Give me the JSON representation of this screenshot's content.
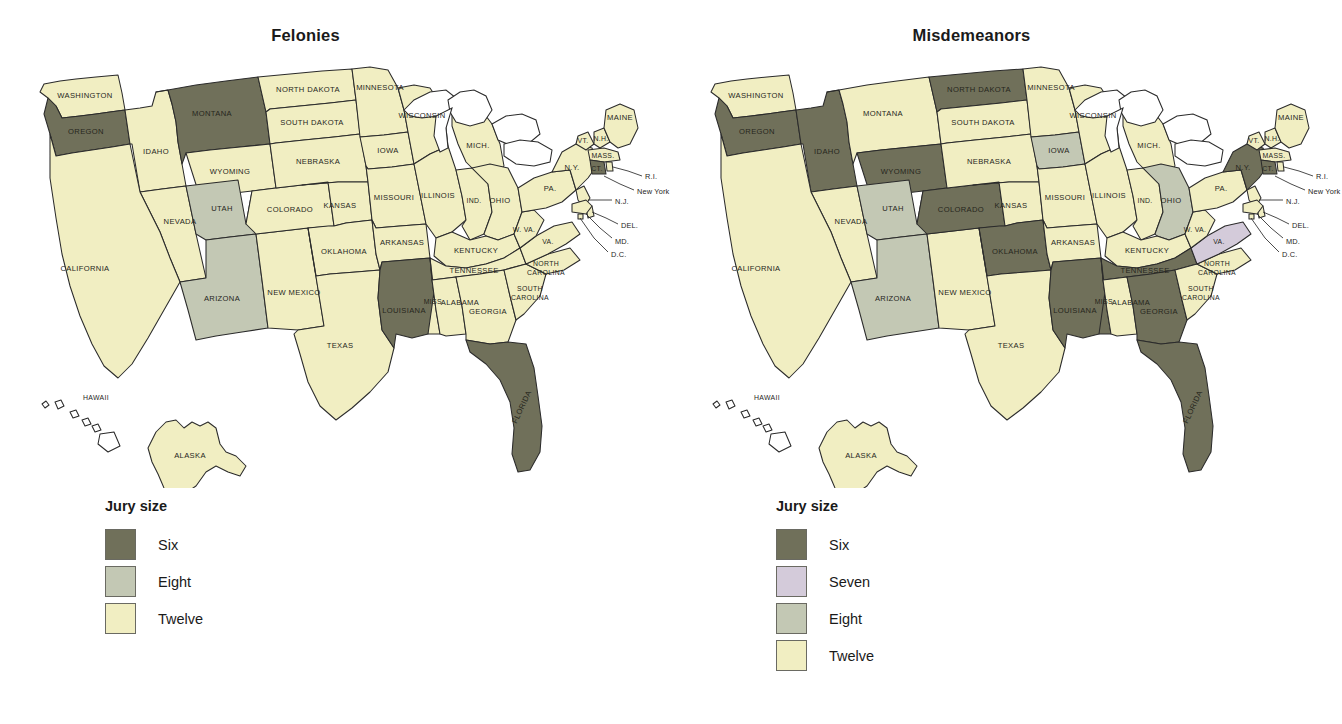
{
  "figure": {
    "cut_caption": "",
    "panels": [
      {
        "id": "felonies",
        "title": "Felonies",
        "legend": {
          "title": "Jury size",
          "items": [
            {
              "label": "Six",
              "color": "#70705a"
            },
            {
              "label": "Eight",
              "color": "#c3c8b4"
            },
            {
              "label": "Twelve",
              "color": "#f1eec2"
            }
          ]
        }
      },
      {
        "id": "misdemeanors",
        "title": "Misdemeanors",
        "legend": {
          "title": "Jury size",
          "items": [
            {
              "label": "Six",
              "color": "#70705a"
            },
            {
              "label": "Seven",
              "color": "#d4cbda"
            },
            {
              "label": "Eight",
              "color": "#c3c8b4"
            },
            {
              "label": "Twelve",
              "color": "#f1eec2"
            }
          ]
        }
      }
    ]
  },
  "chart_data": {
    "type": "map",
    "legend_title": "Jury size",
    "colors": {
      "six": "#70705a",
      "seven": "#d4cbda",
      "eight": "#c3c8b4",
      "twelve": "#f1eec2",
      "none": "#ffffff",
      "outline": "#2b2b2b"
    },
    "maps": [
      {
        "name": "Felonies",
        "categories": [
          "Six",
          "Eight",
          "Twelve"
        ],
        "values": {
          "WASHINGTON": "Twelve",
          "OREGON": "Six",
          "IDAHO": "Twelve",
          "MONTANA": "Six",
          "WYOMING": "Twelve",
          "NEVADA": "Twelve",
          "UTAH": "Eight",
          "CALIFORNIA": "Twelve",
          "ARIZONA": "Eight",
          "NEW MEXICO": "Twelve",
          "COLORADO": "Twelve",
          "NORTH DAKOTA": "Twelve",
          "SOUTH DAKOTA": "Twelve",
          "NEBRASKA": "Twelve",
          "KANSAS": "Twelve",
          "OKLAHOMA": "Twelve",
          "TEXAS": "Twelve",
          "MINNESOTA": "Twelve",
          "IOWA": "Twelve",
          "MISSOURI": "Twelve",
          "ARKANSAS": "Twelve",
          "LOUISIANA": "Six",
          "WISCONSIN": "Twelve",
          "ILLINOIS": "Twelve",
          "MICHIGAN": "Twelve",
          "INDIANA": "Twelve",
          "OHIO": "Twelve",
          "KENTUCKY": "Twelve",
          "TENNESSEE": "Twelve",
          "MISSISSIPPI": "Twelve",
          "ALABAMA": "Twelve",
          "GEORGIA": "Twelve",
          "FLORIDA": "Six",
          "SOUTH CAROLINA": "Twelve",
          "NORTH CAROLINA": "Twelve",
          "VIRGINIA": "Twelve",
          "WEST VIRGINIA": "Twelve",
          "PENNSYLVANIA": "Twelve",
          "NEW YORK": "Twelve",
          "VERMONT": "Twelve",
          "NEW HAMPSHIRE": "Twelve",
          "MAINE": "Twelve",
          "MASSACHUSETTS": "Twelve",
          "CONNECTICUT": "Six",
          "RHODE ISLAND": "Twelve",
          "NEW JERSEY": "Twelve",
          "DELAWARE": "Twelve",
          "MARYLAND": "Twelve",
          "D.C.": "Twelve",
          "ALASKA": "Twelve",
          "HAWAII": "None"
        }
      },
      {
        "name": "Misdemeanors",
        "categories": [
          "Six",
          "Seven",
          "Eight",
          "Twelve"
        ],
        "values": {
          "WASHINGTON": "Twelve",
          "OREGON": "Six",
          "IDAHO": "Six",
          "MONTANA": "Twelve",
          "WYOMING": "Six",
          "NEVADA": "Twelve",
          "UTAH": "Eight",
          "CALIFORNIA": "Twelve",
          "ARIZONA": "Eight",
          "NEW MEXICO": "Twelve",
          "COLORADO": "Six",
          "NORTH DAKOTA": "Six",
          "SOUTH DAKOTA": "Twelve",
          "NEBRASKA": "Twelve",
          "KANSAS": "Twelve",
          "OKLAHOMA": "Six",
          "TEXAS": "Twelve",
          "MINNESOTA": "Twelve",
          "IOWA": "Eight",
          "MISSOURI": "Twelve",
          "ARKANSAS": "Twelve",
          "LOUISIANA": "Six",
          "WISCONSIN": "Twelve",
          "ILLINOIS": "Twelve",
          "MICHIGAN": "Twelve",
          "INDIANA": "Twelve",
          "OHIO": "Eight",
          "KENTUCKY": "Twelve",
          "TENNESSEE": "Six",
          "MISSISSIPPI": "Six",
          "ALABAMA": "Twelve",
          "GEORGIA": "Six",
          "FLORIDA": "Six",
          "SOUTH CAROLINA": "Twelve",
          "NORTH CAROLINA": "Twelve",
          "VIRGINIA": "Seven",
          "WEST VIRGINIA": "Twelve",
          "PENNSYLVANIA": "Twelve",
          "NEW YORK": "Six",
          "VERMONT": "Twelve",
          "NEW HAMPSHIRE": "Twelve",
          "MAINE": "Twelve",
          "MASSACHUSETTS": "Twelve",
          "CONNECTICUT": "Six",
          "RHODE ISLAND": "Twelve",
          "NEW JERSEY": "Twelve",
          "DELAWARE": "Twelve",
          "MARYLAND": "Twelve",
          "D.C.": "Twelve",
          "ALASKA": "Twelve",
          "HAWAII": "None"
        }
      }
    ],
    "state_labels": [
      "WASHINGTON",
      "OREGON",
      "IDAHO",
      "MONTANA",
      "WYOMING",
      "NEVADA",
      "UTAH",
      "CALIFORNIA",
      "ARIZONA",
      "NEW MEXICO",
      "COLORADO",
      "NORTH DAKOTA",
      "SOUTH DAKOTA",
      "NEBRASKA",
      "KANSAS",
      "OKLAHOMA",
      "TEXAS",
      "MINNESOTA",
      "IOWA",
      "MISSOURI",
      "ARKANSAS",
      "LOUISIANA",
      "WISCONSIN",
      "ILLINOIS",
      "MICH.",
      "IND.",
      "OHIO",
      "KENTUCKY",
      "TENNESSEE",
      "MISS.",
      "ALABAMA",
      "GEORGIA",
      "FLORIDA",
      "SOUTH CAROLINA",
      "NORTH CAROLINA",
      "VA.",
      "W. VA.",
      "PA.",
      "N.Y.",
      "VT.",
      "N.H.",
      "MAINE",
      "MASS.",
      "CT.",
      "R.I.",
      "New York",
      "N.J.",
      "DEL.",
      "MD.",
      "D.C.",
      "ALASKA",
      "HAWAII"
    ]
  }
}
